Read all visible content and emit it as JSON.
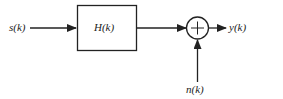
{
  "diagram": {
    "input_label": "s(k)",
    "block_label": "H(k)",
    "output_label": "y(k)",
    "noise_label": "n(k)",
    "summer_symbol": "+",
    "line_color": "#222222"
  }
}
